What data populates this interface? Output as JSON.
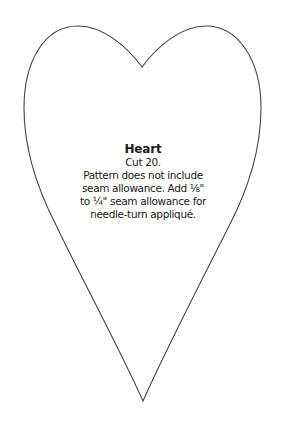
{
  "pattern": {
    "shape": "heart",
    "outline_color": "#454545",
    "background_color": "#ffffff",
    "text_color": "#1a1a1a",
    "label": {
      "title": "Heart",
      "cut": "Cut 20.",
      "instructions_lines": [
        "Pattern does not include",
        "seam allowance. Add ⅛\"",
        "to ¼\" seam allowance for",
        "needle-turn appliqué."
      ]
    }
  }
}
